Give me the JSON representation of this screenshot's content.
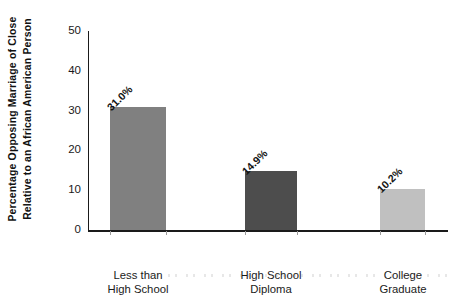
{
  "chart_data": {
    "type": "bar",
    "title": "",
    "xlabel": "",
    "ylabel": "Percentage Opposing Marriage of Close Relative to an African American Person",
    "ylabel_lines": [
      "Percentage Opposing Marriage of Close",
      "Relative to an African American Person"
    ],
    "categories": [
      "Less than High School",
      "High School Diploma",
      "College Graduate"
    ],
    "category_lines": [
      [
        "Less than",
        "High School"
      ],
      [
        "High School",
        "Diploma"
      ],
      [
        "College",
        "Graduate"
      ]
    ],
    "values": [
      31.0,
      14.9,
      10.2
    ],
    "value_labels": [
      "31.0%",
      "14.9%",
      "10.2%"
    ],
    "bar_colors": [
      "#808080",
      "#4d4d4d",
      "#c0c0c0"
    ],
    "ylim": [
      0,
      50
    ],
    "yticks": [
      0,
      10,
      20,
      30,
      40,
      50
    ],
    "ytick_labels": [
      "0",
      "10",
      "20",
      "30",
      "40",
      "50"
    ],
    "grid": false,
    "legend": "none",
    "background_color": "#ffffff",
    "axis_color": "#1a1a1a"
  }
}
